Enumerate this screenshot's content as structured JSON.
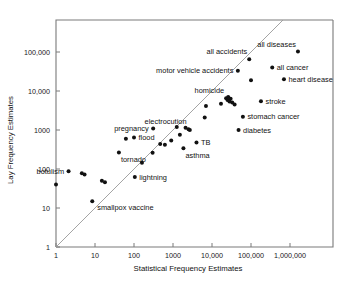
{
  "chart_data": {
    "type": "scatter",
    "title": "",
    "xlabel": "Statistical Frequency Estimates",
    "ylabel": "Lay Frequency Estimates",
    "xscale": "log",
    "yscale": "log",
    "xlim": [
      1,
      5000000
    ],
    "ylim": [
      1,
      600000
    ],
    "grid": false,
    "legend": null,
    "xticks": [
      1,
      10,
      100,
      1000,
      10000,
      100000,
      1000000
    ],
    "xticklabels": [
      "1",
      "10",
      "100",
      "1000",
      "10,000",
      "100,000",
      "1,000,000"
    ],
    "yticks": [
      1,
      10,
      100,
      1000,
      10000,
      100000
    ],
    "yticklabels": [
      "1",
      "10",
      "100",
      "1000",
      "10,000",
      "100,000"
    ],
    "reference_line": {
      "name": "identity-line",
      "description": "y = x diagonal",
      "from": [
        1,
        1
      ],
      "to": [
        1000000,
        1000000
      ]
    },
    "points": [
      {
        "label": "smallpox vaccine",
        "x": 1,
        "y": 40,
        "label_pos": "none"
      },
      {
        "label": "botulism",
        "x": 2.1,
        "y": 88,
        "label_pos": "left"
      },
      {
        "label": "",
        "x": 4.6,
        "y": 78,
        "label_pos": "none"
      },
      {
        "label": "",
        "x": 5.4,
        "y": 72,
        "label_pos": "none"
      },
      {
        "label": "",
        "x": 8.5,
        "y": 15,
        "label_pos": "none"
      },
      {
        "label": "",
        "x": 15,
        "y": 50,
        "label_pos": "none"
      },
      {
        "label": "",
        "x": 18,
        "y": 46,
        "label_pos": "none"
      },
      {
        "label": "tornado",
        "x": 41,
        "y": 265,
        "label_pos": "below"
      },
      {
        "label": "",
        "x": 62,
        "y": 600,
        "label_pos": "none"
      },
      {
        "label": "flood",
        "x": 100,
        "y": 640,
        "label_pos": "right"
      },
      {
        "label": "lightning",
        "x": 105,
        "y": 62,
        "label_pos": "right"
      },
      {
        "label": "pregnancy",
        "x": 310,
        "y": 1100,
        "label_pos": "left"
      },
      {
        "label": "",
        "x": 160,
        "y": 145,
        "label_pos": "none"
      },
      {
        "label": "",
        "x": 300,
        "y": 260,
        "label_pos": "none"
      },
      {
        "label": "",
        "x": 470,
        "y": 440,
        "label_pos": "none"
      },
      {
        "label": "",
        "x": 620,
        "y": 420,
        "label_pos": "none"
      },
      {
        "label": "",
        "x": 900,
        "y": 540,
        "label_pos": "none"
      },
      {
        "label": "",
        "x": 1250,
        "y": 1200,
        "label_pos": "none"
      },
      {
        "label": "",
        "x": 1500,
        "y": 760,
        "label_pos": "none"
      },
      {
        "label": "asthma",
        "x": 1850,
        "y": 340,
        "label_pos": "below"
      },
      {
        "label": "",
        "x": 2100,
        "y": 1150,
        "label_pos": "none"
      },
      {
        "label": "electrocution",
        "x": 2500,
        "y": 1050,
        "label_pos": "above"
      },
      {
        "label": "",
        "x": 2700,
        "y": 1000,
        "label_pos": "none"
      },
      {
        "label": "TB",
        "x": 4000,
        "y": 480,
        "label_pos": "right"
      },
      {
        "label": "",
        "x": 6500,
        "y": 2100,
        "label_pos": "none"
      },
      {
        "label": "",
        "x": 7000,
        "y": 4100,
        "label_pos": "none"
      },
      {
        "label": "",
        "x": 17000,
        "y": 4700,
        "label_pos": "none"
      },
      {
        "label": "homicide",
        "x": 23000,
        "y": 6500,
        "label_pos": "above"
      },
      {
        "label": "",
        "x": 25000,
        "y": 5900,
        "label_pos": "none"
      },
      {
        "label": "",
        "x": 26000,
        "y": 7000,
        "label_pos": "none"
      },
      {
        "label": "",
        "x": 28000,
        "y": 5400,
        "label_pos": "none"
      },
      {
        "label": "",
        "x": 30000,
        "y": 6300,
        "label_pos": "none"
      },
      {
        "label": "",
        "x": 33000,
        "y": 5100,
        "label_pos": "none"
      },
      {
        "label": "",
        "x": 38000,
        "y": 4500,
        "label_pos": "none"
      },
      {
        "label": "motor vehicle accidents",
        "x": 46000,
        "y": 33000,
        "label_pos": "left"
      },
      {
        "label": "diabetes",
        "x": 48000,
        "y": 1000,
        "label_pos": "right"
      },
      {
        "label": "stomach cancer",
        "x": 62000,
        "y": 2200,
        "label_pos": "right"
      },
      {
        "label": "all accidents",
        "x": 90000,
        "y": 65000,
        "label_pos": "above"
      },
      {
        "label": "",
        "x": 100000,
        "y": 19000,
        "label_pos": "none"
      },
      {
        "label": "stroke",
        "x": 180000,
        "y": 5500,
        "label_pos": "right"
      },
      {
        "label": "all cancer",
        "x": 350000,
        "y": 40000,
        "label_pos": "right"
      },
      {
        "label": "heart disease",
        "x": 700000,
        "y": 20000,
        "label_pos": "right"
      },
      {
        "label": "all diseases",
        "x": 1600000,
        "y": 103000,
        "label_pos": "above"
      }
    ],
    "annotations": [
      {
        "name": "label-all-diseases",
        "text": "all diseases"
      },
      {
        "name": "label-all-accidents",
        "text": "all accidents"
      },
      {
        "name": "label-motor-vehicle-accidents",
        "text": "motor vehicle accidents"
      },
      {
        "name": "label-all-cancer",
        "text": "all cancer"
      },
      {
        "name": "label-heart-disease",
        "text": "heart disease"
      },
      {
        "name": "label-homicide",
        "text": "homicide"
      },
      {
        "name": "label-stroke",
        "text": "stroke"
      },
      {
        "name": "label-stomach-cancer",
        "text": "stomach cancer"
      },
      {
        "name": "label-diabetes",
        "text": "diabetes"
      },
      {
        "name": "label-electrocution",
        "text": "electrocution"
      },
      {
        "name": "label-pregnancy",
        "text": "pregnancy"
      },
      {
        "name": "label-flood",
        "text": "flood"
      },
      {
        "name": "label-tornado",
        "text": "tornado"
      },
      {
        "name": "label-tb",
        "text": "TB"
      },
      {
        "name": "label-asthma",
        "text": "asthma"
      },
      {
        "name": "label-botulism",
        "text": "botulism"
      },
      {
        "name": "label-lightning",
        "text": "lightning"
      },
      {
        "name": "label-smallpox-vaccine",
        "text": "smallpox vaccine"
      }
    ]
  },
  "axes": {
    "x_title": "Statistical Frequency Estimates",
    "y_title": "Lay Frequency Estimates",
    "x_tick_labels": [
      "1",
      "10",
      "100",
      "1000",
      "10,000",
      "100,000",
      "1,000,000"
    ],
    "y_tick_labels": [
      "1",
      "10",
      "100",
      "1000",
      "10,000",
      "100,000"
    ]
  },
  "colors": {
    "background": "#ffffff",
    "axis": "#7a7a7a",
    "marker": "#111111",
    "reference_line": "#9a9a9a",
    "text": "#111111"
  },
  "point_labels": {
    "all_diseases": "all diseases",
    "all_accidents": "all accidents",
    "motor_vehicle_accidents": "motor vehicle accidents",
    "all_cancer": "all cancer",
    "heart_disease": "heart disease",
    "homicide": "homicide",
    "stroke": "stroke",
    "stomach_cancer": "stomach cancer",
    "diabetes": "diabetes",
    "electrocution": "electrocution",
    "pregnancy": "pregnancy",
    "flood": "flood",
    "tornado": "tornado",
    "tb": "TB",
    "asthma": "asthma",
    "botulism": "botulism",
    "lightning": "lightning",
    "smallpox_vaccine": "smallpox vaccine"
  }
}
